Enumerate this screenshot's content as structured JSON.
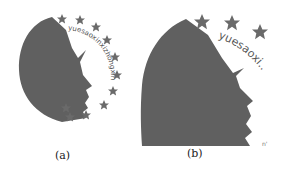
{
  "figure_a": {
    "caption": "(a)",
    "arc_text": "yuesaoxinxizhongxin",
    "silhouette_color": "#606060",
    "star_color": "#6a6a6a",
    "star_count": 11
  },
  "figure_b": {
    "caption": "(b)",
    "arc_text": "yuesaoxi..",
    "silhouette_color": "#606060",
    "star_color": "#6a6a6a",
    "star_count": 3
  }
}
